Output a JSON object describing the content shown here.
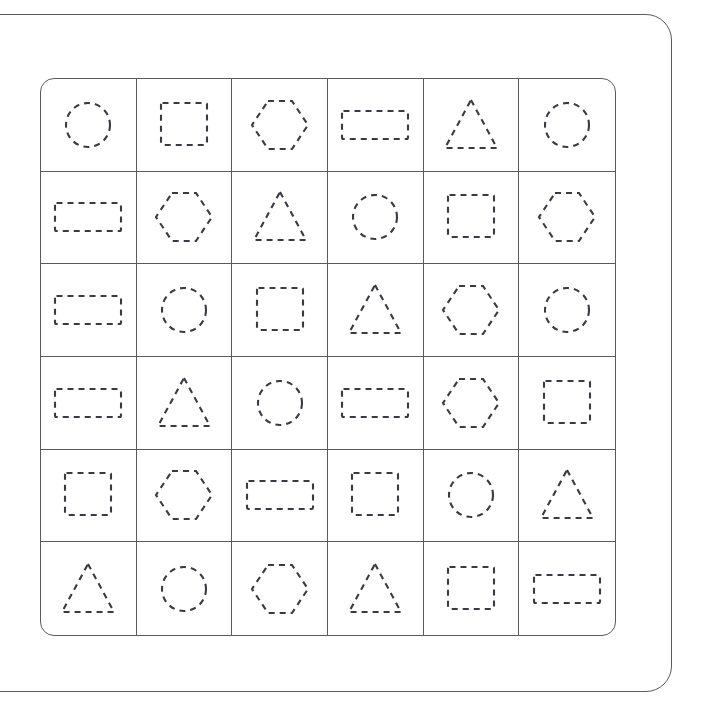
{
  "worksheet": {
    "title": "Shape Tracing Worksheet",
    "grid": {
      "rows": 6,
      "columns": 6,
      "cell_style": "dashed-outline-trace",
      "stroke_color": "#3a3a42",
      "border_color": "#5a5a5f",
      "background_color": "#ffffff"
    },
    "shape_legend": {
      "circle": "circle-shape",
      "square": "square-shape",
      "rectangle": "rectangle-shape",
      "triangle": "triangle-shape",
      "hexagon": "hexagon-shape"
    },
    "cells": [
      [
        {
          "row": 1,
          "col": 1,
          "shape": "circle"
        },
        {
          "row": 1,
          "col": 2,
          "shape": "square"
        },
        {
          "row": 1,
          "col": 3,
          "shape": "hexagon"
        },
        {
          "row": 1,
          "col": 4,
          "shape": "rectangle"
        },
        {
          "row": 1,
          "col": 5,
          "shape": "triangle"
        },
        {
          "row": 1,
          "col": 6,
          "shape": "circle"
        }
      ],
      [
        {
          "row": 2,
          "col": 1,
          "shape": "rectangle"
        },
        {
          "row": 2,
          "col": 2,
          "shape": "hexagon"
        },
        {
          "row": 2,
          "col": 3,
          "shape": "triangle"
        },
        {
          "row": 2,
          "col": 4,
          "shape": "circle"
        },
        {
          "row": 2,
          "col": 5,
          "shape": "square"
        },
        {
          "row": 2,
          "col": 6,
          "shape": "hexagon"
        }
      ],
      [
        {
          "row": 3,
          "col": 1,
          "shape": "rectangle"
        },
        {
          "row": 3,
          "col": 2,
          "shape": "circle"
        },
        {
          "row": 3,
          "col": 3,
          "shape": "square"
        },
        {
          "row": 3,
          "col": 4,
          "shape": "triangle"
        },
        {
          "row": 3,
          "col": 5,
          "shape": "hexagon"
        },
        {
          "row": 3,
          "col": 6,
          "shape": "circle"
        }
      ],
      [
        {
          "row": 4,
          "col": 1,
          "shape": "rectangle"
        },
        {
          "row": 4,
          "col": 2,
          "shape": "triangle"
        },
        {
          "row": 4,
          "col": 3,
          "shape": "circle"
        },
        {
          "row": 4,
          "col": 4,
          "shape": "rectangle"
        },
        {
          "row": 4,
          "col": 5,
          "shape": "hexagon"
        },
        {
          "row": 4,
          "col": 6,
          "shape": "square"
        }
      ],
      [
        {
          "row": 5,
          "col": 1,
          "shape": "square"
        },
        {
          "row": 5,
          "col": 2,
          "shape": "hexagon"
        },
        {
          "row": 5,
          "col": 3,
          "shape": "rectangle"
        },
        {
          "row": 5,
          "col": 4,
          "shape": "square"
        },
        {
          "row": 5,
          "col": 5,
          "shape": "circle"
        },
        {
          "row": 5,
          "col": 6,
          "shape": "triangle"
        }
      ],
      [
        {
          "row": 6,
          "col": 1,
          "shape": "triangle"
        },
        {
          "row": 6,
          "col": 2,
          "shape": "circle"
        },
        {
          "row": 6,
          "col": 3,
          "shape": "hexagon"
        },
        {
          "row": 6,
          "col": 4,
          "shape": "triangle"
        },
        {
          "row": 6,
          "col": 5,
          "shape": "square"
        },
        {
          "row": 6,
          "col": 6,
          "shape": "rectangle"
        }
      ]
    ]
  }
}
